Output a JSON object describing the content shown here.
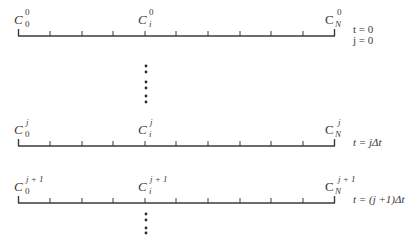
{
  "diagram": {
    "rows": [
      {
        "level": "0",
        "left_label": {
          "base": "C",
          "sup": "0",
          "sub": "0"
        },
        "mid_label": {
          "base": "C",
          "sup": "0",
          "sub": "i"
        },
        "right_label": {
          "base": "C",
          "sup": "0",
          "sub": "N"
        },
        "time_label_1": "t = 0",
        "time_label_2": "j = 0"
      },
      {
        "level": "j",
        "left_label": {
          "base": "C",
          "sup": "j",
          "sub": "0"
        },
        "mid_label": {
          "base": "C",
          "sup": "j",
          "sub": "i"
        },
        "right_label": {
          "base": "C",
          "sup": "j",
          "sub": "N"
        },
        "time_label_1": "t = jΔt"
      },
      {
        "level": "j+1",
        "left_label": {
          "base": "C",
          "sup": "j + 1",
          "sub": "0"
        },
        "mid_label": {
          "base": "C",
          "sup": "j + 1",
          "sub": "i"
        },
        "right_label": {
          "base": "C",
          "sup": "j + 1",
          "sub": "N"
        },
        "time_label_1": "t = (j +1)Δt"
      }
    ],
    "intervals_per_row": 10,
    "ellipsis": "vertical dots (continuation)",
    "line_color": "#3a3a3a"
  }
}
